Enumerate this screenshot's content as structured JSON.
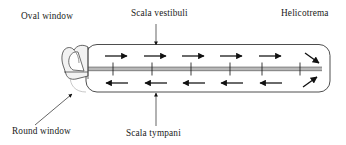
{
  "figure": {
    "labels": {
      "oval_window": "Oval window",
      "scala_vestibuli": "Scala vestibuli",
      "helicotrema": "Helicotrema",
      "round_window": "Round window",
      "scala_tympani": "Scala tympani"
    },
    "colors": {
      "stroke": "#1a1a1a",
      "membrane": "#9a9a9a",
      "outline": "#3a3a3a",
      "background": "#ffffff"
    },
    "arrows": {
      "scala_vestibuli_direction": "right",
      "scala_vestibuli_count": 5,
      "scala_tympani_direction": "left",
      "scala_tympani_count": 5,
      "helicotrema_turn": "around end",
      "membrane_ticks": 6
    }
  }
}
